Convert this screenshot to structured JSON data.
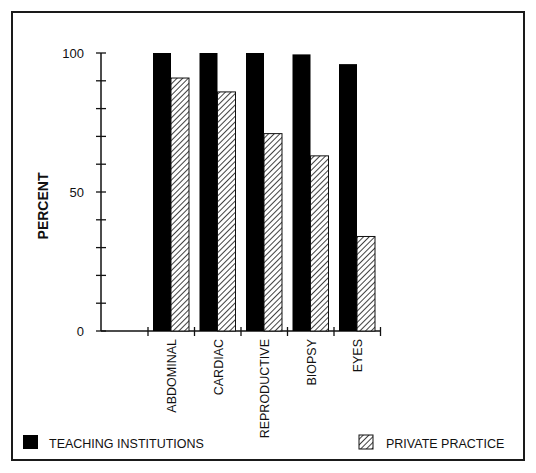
{
  "chart_data": {
    "type": "bar",
    "title": "",
    "xlabel": "",
    "ylabel": "PERCENT",
    "ylim": [
      0,
      100
    ],
    "yticks": [
      0,
      50,
      100
    ],
    "minor_tick_step": 10,
    "grid": false,
    "legend_position": "bottom",
    "categories": [
      "ABDOMINAL",
      "CARDIAC",
      "REPRODUCTIVE",
      "BIOPSY",
      "EYES"
    ],
    "series": [
      {
        "name": "TEACHING INSTITUTIONS",
        "fill": "solid",
        "color": "#000000",
        "values": [
          100,
          100,
          100,
          99.5,
          96
        ]
      },
      {
        "name": "PRIVATE PRACTICE",
        "fill": "hatched",
        "color": "#000000",
        "values": [
          91,
          86,
          71,
          63,
          34
        ]
      }
    ]
  },
  "legend": {
    "teaching_label": "TEACHING INSTITUTIONS",
    "private_label": "PRIVATE PRACTICE"
  },
  "axis": {
    "ylabel": "PERCENT",
    "tick_100": "100",
    "tick_50": "50",
    "tick_0": "0"
  }
}
